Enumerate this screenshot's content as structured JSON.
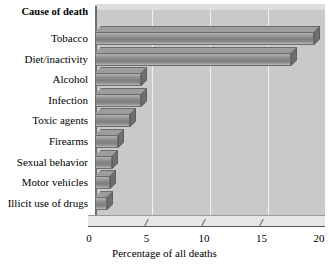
{
  "chart_data": {
    "type": "bar",
    "orientation": "horizontal",
    "title": "",
    "xlabel": "Percentage of all deaths",
    "ylabel": "Cause of death",
    "categories": [
      "Tobacco",
      "Diet/inactivity",
      "Alcohol",
      "Infection",
      "Toxic agents",
      "Firearms",
      "Sexual behavior",
      "Motor vehicles",
      "Illicit use of drugs"
    ],
    "values": [
      19,
      17,
      4,
      4,
      3,
      2,
      1.5,
      1.3,
      1
    ],
    "xlim": [
      0,
      20
    ],
    "xticks": [
      0,
      5,
      10,
      15,
      20
    ],
    "xtick_labels": [
      "0",
      "5",
      "10",
      "15",
      "20"
    ],
    "grid": true,
    "legend": false,
    "style_3d": true
  },
  "axis": {
    "category_header": "Cause of death",
    "x_axis_title": "Percentage of all deaths"
  },
  "colors": {
    "plot_background": "#c9c9c9",
    "gridline": "#f2f2f2",
    "bar_fill": "#8b8b8b",
    "bar_outline": "#6b6b6b",
    "page_background": "#ffffff",
    "text": "#000000"
  }
}
